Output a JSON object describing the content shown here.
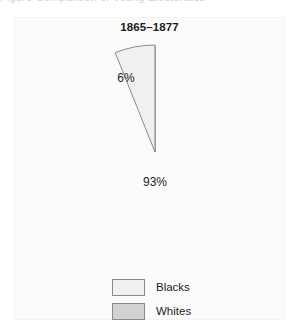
{
  "figure": {
    "heading_cropped": "Figure   Comparison of Voting Electorates",
    "period_label": "1865–1877"
  },
  "legend": {
    "items": [
      {
        "label": "Blacks",
        "color": "#f0f0f0"
      },
      {
        "label": "Whites",
        "color": "#d2d2d2"
      }
    ]
  },
  "colors": {
    "panel_background": "#fbfbfb",
    "slice_blacks": "#f0f0f0",
    "slice_whites": "#d2d2d2",
    "outline": "#8b8b8b",
    "text": "#1d1d1d"
  },
  "chart_data": {
    "type": "pie",
    "title": "1865–1877",
    "categories": [
      "Blacks",
      "Whites"
    ],
    "values": [
      6,
      93
    ],
    "value_labels": [
      "6%",
      "93%"
    ],
    "unit": "percent",
    "colors": [
      "#f0f0f0",
      "#d2d2d2"
    ],
    "start_angle_deg": 90,
    "direction": "counterclockwise",
    "legend_position": "bottom",
    "grid": false
  }
}
